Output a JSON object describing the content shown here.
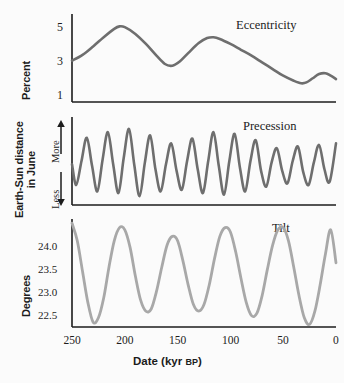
{
  "figure": {
    "background_color": "#fbfbfb",
    "axis_color": "#1c1c1c"
  },
  "xaxis": {
    "title_main": "Date (kyr ",
    "title_caps": "BP",
    "title_close": ")",
    "ticks": [
      "250",
      "200",
      "150",
      "100",
      "50",
      "0"
    ],
    "tick_values": [
      250,
      200,
      150,
      100,
      50,
      0
    ],
    "range": [
      250,
      0
    ],
    "units": "kyr BP"
  },
  "panels": [
    {
      "key": "eccentricity",
      "title": "Eccentricity",
      "yaxis_title": "Percent",
      "yticks": [
        "5",
        "3",
        "1"
      ],
      "ytick_values": [
        5,
        3,
        1
      ],
      "curve_color": "#6e6e6e"
    },
    {
      "key": "precession",
      "title": "Precession",
      "yaxis_title_line1": "Earth-Sun distance",
      "yaxis_title_line2": "in June",
      "ytop_label": "More",
      "ybottom_label": "Less",
      "curve_color": "#6e6e6e"
    },
    {
      "key": "tilt",
      "title": "Tilt",
      "yaxis_title": "Degrees",
      "yticks": [
        "24.0",
        "23.5",
        "23.0",
        "22.5"
      ],
      "ytick_values": [
        24.0,
        23.5,
        23.0,
        22.5
      ],
      "curve_color": "#a8a8a8"
    }
  ],
  "chart_data": [
    {
      "type": "line",
      "title": "Eccentricity",
      "xlabel": "Date (kyr BP)",
      "ylabel": "Percent",
      "xlim": [
        250,
        0
      ],
      "ylim": [
        0.6,
        5.5
      ],
      "yticks": [
        1,
        3,
        5
      ],
      "grid": false,
      "x": [
        250,
        240,
        230,
        220,
        210,
        205,
        200,
        190,
        180,
        170,
        162,
        155,
        148,
        140,
        130,
        122,
        116,
        110,
        100,
        90,
        80,
        70,
        60,
        50,
        40,
        33,
        28,
        22,
        16,
        10,
        5,
        0
      ],
      "values": [
        2.95,
        3.3,
        3.8,
        4.35,
        4.85,
        5.0,
        4.95,
        4.55,
        3.95,
        3.25,
        2.75,
        2.65,
        2.9,
        3.4,
        4.0,
        4.3,
        4.35,
        4.25,
        3.95,
        3.6,
        3.25,
        2.85,
        2.45,
        2.05,
        1.75,
        1.6,
        1.65,
        1.9,
        2.15,
        2.2,
        2.05,
        1.85
      ]
    },
    {
      "type": "line",
      "title": "Precession",
      "xlabel": "Date (kyr BP)",
      "ylabel": "Earth-Sun distance in June",
      "xlim": [
        250,
        0
      ],
      "ylim": [
        0,
        1
      ],
      "ytick_labels": [
        "Less",
        "More"
      ],
      "grid": false,
      "period_kyr": 21,
      "x": [
        250,
        246,
        241,
        236,
        231,
        226,
        221,
        216,
        211,
        206,
        201,
        196,
        191,
        186,
        181,
        176,
        171,
        166,
        161,
        156,
        151,
        146,
        141,
        136,
        131,
        126,
        121,
        116,
        111,
        106,
        101,
        96,
        91,
        86,
        81,
        76,
        71,
        66,
        61,
        56,
        51,
        46,
        41,
        36,
        31,
        26,
        21,
        16,
        11,
        6,
        0
      ],
      "values": [
        0.46,
        0.2,
        0.5,
        0.79,
        0.44,
        0.12,
        0.52,
        0.86,
        0.46,
        0.1,
        0.54,
        0.9,
        0.45,
        0.06,
        0.48,
        0.82,
        0.4,
        0.12,
        0.46,
        0.72,
        0.38,
        0.14,
        0.5,
        0.78,
        0.4,
        0.1,
        0.5,
        0.86,
        0.44,
        0.08,
        0.5,
        0.84,
        0.42,
        0.12,
        0.5,
        0.76,
        0.38,
        0.18,
        0.48,
        0.66,
        0.38,
        0.22,
        0.5,
        0.68,
        0.36,
        0.2,
        0.48,
        0.7,
        0.4,
        0.24,
        0.72
      ]
    },
    {
      "type": "line",
      "title": "Tilt",
      "xlabel": "Date (kyr BP)",
      "ylabel": "Degrees",
      "xlim": [
        250,
        0
      ],
      "ylim": [
        22.05,
        24.55
      ],
      "yticks": [
        22.5,
        23.0,
        23.5,
        24.0
      ],
      "grid": false,
      "period_kyr": 41,
      "x": [
        250,
        245,
        240,
        235,
        230,
        225,
        220,
        215,
        210,
        205,
        200,
        195,
        190,
        185,
        180,
        175,
        170,
        165,
        160,
        155,
        150,
        145,
        140,
        135,
        130,
        125,
        120,
        115,
        110,
        105,
        100,
        95,
        90,
        85,
        80,
        75,
        70,
        65,
        60,
        55,
        50,
        45,
        40,
        35,
        30,
        25,
        20,
        15,
        10,
        5,
        0
      ],
      "values": [
        24.5,
        24.1,
        23.4,
        22.7,
        22.25,
        22.35,
        22.8,
        23.5,
        24.1,
        24.4,
        24.35,
        23.95,
        23.3,
        22.75,
        22.5,
        22.55,
        22.95,
        23.5,
        24.0,
        24.2,
        24.1,
        23.65,
        23.1,
        22.65,
        22.5,
        22.65,
        23.1,
        23.7,
        24.2,
        24.4,
        24.3,
        23.85,
        23.25,
        22.7,
        22.4,
        22.45,
        22.85,
        23.45,
        24.0,
        24.35,
        24.4,
        24.1,
        23.5,
        22.85,
        22.35,
        22.2,
        22.5,
        23.1,
        23.8,
        24.35,
        23.6
      ]
    }
  ]
}
